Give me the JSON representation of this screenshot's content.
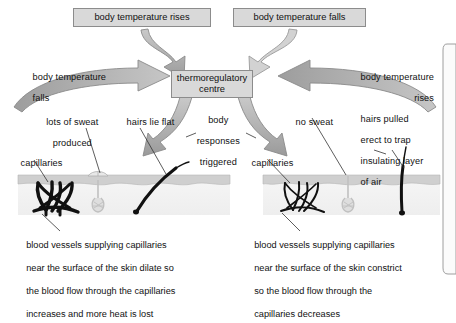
{
  "diagram": {
    "colors": {
      "box_fill": "#d9d9d9",
      "box_stroke": "#8c8c8c",
      "arrow_fill": "#b3b3b3",
      "arrow_stroke": "#8a8a8a",
      "skin_fill": "#f2f2f2",
      "epidermis_fill": "#cfcfcf",
      "capillary_dilated": "#111111",
      "capillary_constricted": "#111111",
      "hair": "#111111",
      "gland": "#cccccc",
      "text": "#111111"
    },
    "stimulus_boxes": [
      {
        "id": "rises",
        "label": "body temperature rises"
      },
      {
        "id": "falls",
        "label": "body temperature falls"
      }
    ],
    "centre_box": {
      "label_line1": "thermoregulatory",
      "label_line2": "centre"
    },
    "feedback_labels": [
      {
        "id": "left-feedback",
        "line1": "body temperature",
        "line2": "falls"
      },
      {
        "id": "right-feedback",
        "line1": "body temperature",
        "line2": "rises"
      }
    ],
    "responses_label": {
      "line1": "body",
      "line2": "responses",
      "line3": "triggered"
    },
    "left_panel": {
      "sweat_label_line1": "lots of sweat",
      "sweat_label_line2": "produced",
      "hair_label": "hairs lie flat",
      "capillaries_label": "capillaries",
      "caption_lines": [
        "blood vessels supplying capillaries",
        "near the surface of the skin dilate so",
        "the blood flow through the capillaries",
        "increases and more heat is lost"
      ]
    },
    "right_panel": {
      "sweat_label": "no sweat",
      "hair_label_lines": [
        "hairs pulled",
        "erect to trap",
        "insulating layer",
        "of air"
      ],
      "capillaries_label": "capillaries",
      "caption_lines": [
        "blood vessels supplying capillaries",
        "near the surface of the skin constrict",
        "so the blood flow through the",
        "capillaries decreases"
      ]
    }
  }
}
